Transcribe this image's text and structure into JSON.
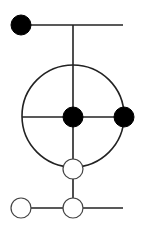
{
  "diagram": {
    "width": 146,
    "height": 234,
    "background": "#ffffff",
    "stroke_color": "#222222",
    "fill_color": "#000000",
    "hollow_fill": "#ffffff",
    "lines": [
      {
        "id": "top-horizontal-line",
        "x1": 21,
        "y1": 25,
        "x2": 123,
        "y2": 25
      },
      {
        "id": "main-vertical-line",
        "x1": 73,
        "y1": 25,
        "x2": 73,
        "y2": 208
      },
      {
        "id": "circle-horizontal-diameter",
        "x1": 22,
        "y1": 117,
        "x2": 124,
        "y2": 117
      },
      {
        "id": "bottom-horizontal-line",
        "x1": 21,
        "y1": 208,
        "x2": 123,
        "y2": 208
      }
    ],
    "big_circle": {
      "cx": 73,
      "cy": 116,
      "r": 51
    },
    "nodes": [
      {
        "id": "top-left-filled-node",
        "cx": 21,
        "cy": 25,
        "r": 10,
        "filled": true
      },
      {
        "id": "center-filled-node",
        "cx": 73,
        "cy": 117,
        "r": 10,
        "filled": true
      },
      {
        "id": "right-filled-node",
        "cx": 124,
        "cy": 117,
        "r": 10,
        "filled": true
      },
      {
        "id": "lower-hollow-node",
        "cx": 73,
        "cy": 169,
        "r": 10,
        "filled": false
      },
      {
        "id": "bottom-left-hollow-node",
        "cx": 21,
        "cy": 208,
        "r": 10,
        "filled": false
      },
      {
        "id": "bottom-middle-hollow-node",
        "cx": 73,
        "cy": 208,
        "r": 10,
        "filled": false
      }
    ]
  }
}
